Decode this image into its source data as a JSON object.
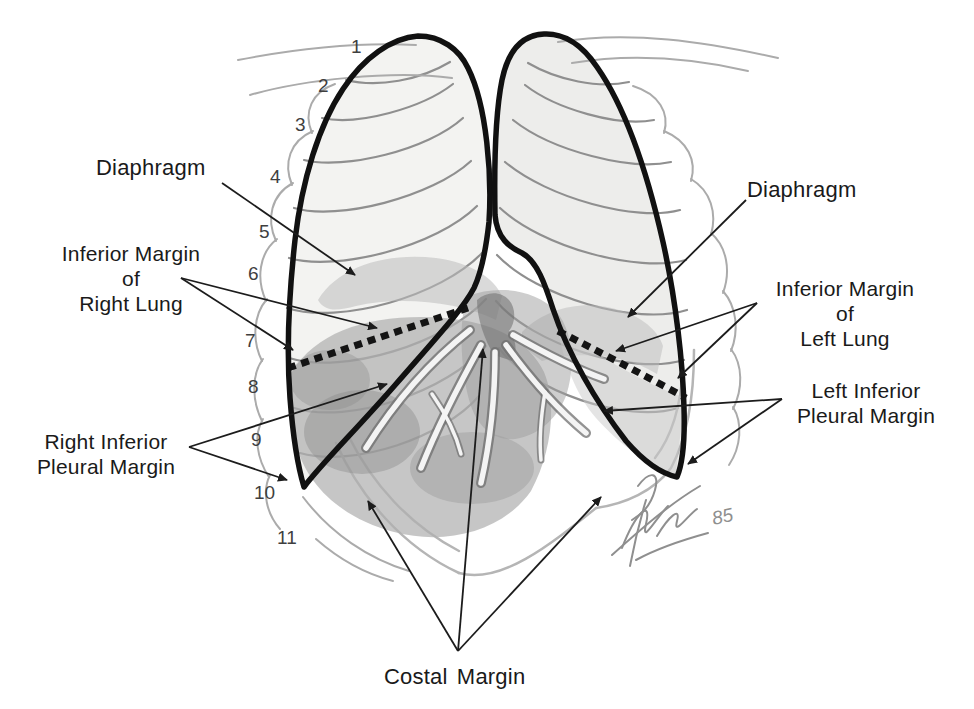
{
  "figure": {
    "labels": {
      "diaphragm_left": "Diaphragm",
      "diaphragm_right": "Diaphragm",
      "inferior_margin_right_lung": [
        "Inferior Margin",
        "of",
        "Right Lung"
      ],
      "inferior_margin_left_lung": [
        "Inferior Margin",
        "of",
        "Left Lung"
      ],
      "right_inferior_pleural_margin": [
        "Right Inferior",
        "Pleural Margin"
      ],
      "left_inferior_pleural_margin": [
        "Left Inferior",
        "Pleural Margin"
      ],
      "costal_margin": "Costal Margin"
    },
    "rib_numbers": [
      "1",
      "2",
      "3",
      "4",
      "5",
      "6",
      "7",
      "8",
      "9",
      "10",
      "11"
    ],
    "signature_year": "85",
    "colors": {
      "background": "#ffffff",
      "outline_ink": "#111111",
      "label_text": "#1a1a1a",
      "rib_gray": "#8f8f8f",
      "organ_gray": "#b0b0b0",
      "pencil_gray": "#8f8f8f"
    }
  }
}
